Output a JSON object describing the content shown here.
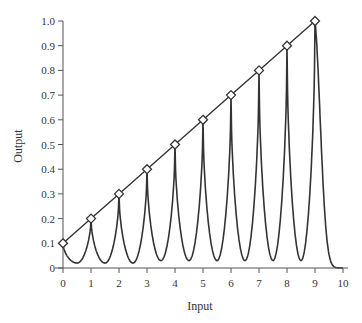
{
  "chart_data": {
    "type": "line",
    "title": "",
    "xlabel": "Input",
    "ylabel": "Output",
    "xlim": [
      0,
      10
    ],
    "ylim": [
      0,
      1.0
    ],
    "grid": false,
    "legend": null,
    "xticks": [
      0,
      1,
      2,
      3,
      4,
      5,
      6,
      7,
      8,
      9,
      10
    ],
    "xtick_labels": [
      "0",
      "1",
      "2",
      "3",
      "4",
      "5",
      "6",
      "7",
      "8",
      "9",
      "10"
    ],
    "yticks": [
      0,
      0.1,
      0.2,
      0.3,
      0.4,
      0.5,
      0.6,
      0.7,
      0.8,
      0.9,
      1.0
    ],
    "ytick_labels": [
      "0",
      "0.1",
      "0.2",
      "0.3",
      "0.4",
      "0.5",
      "0.6",
      "0.7",
      "0.8",
      "0.9",
      "1.0"
    ],
    "series": [
      {
        "name": "Linear (markers)",
        "style": "line with diamond markers",
        "x": [
          0,
          1,
          2,
          3,
          4,
          5,
          6,
          7,
          8,
          9
        ],
        "y": [
          0.1,
          0.2,
          0.3,
          0.4,
          0.5,
          0.6,
          0.7,
          0.8,
          0.9,
          1.0
        ]
      },
      {
        "name": "Oscillating response",
        "style": "line",
        "peaks_x": [
          0,
          1,
          2,
          3,
          4,
          5,
          6,
          7,
          8,
          9
        ],
        "peaks_y": [
          0.1,
          0.2,
          0.3,
          0.4,
          0.5,
          0.6,
          0.7,
          0.8,
          0.9,
          1.0
        ],
        "troughs_x": [
          0.5,
          1.5,
          2.5,
          3.5,
          4.5,
          5.5,
          6.5,
          7.5,
          8.5
        ],
        "troughs_y": [
          0.02,
          0.02,
          0.02,
          0.03,
          0.03,
          0.03,
          0.03,
          0.03,
          0.03
        ],
        "tail": {
          "x_start": 9,
          "x_end": 10,
          "y_end": 0.0
        }
      }
    ],
    "colors": {
      "line": "#333333",
      "marker_fill": "#ffffff",
      "axis": "#555555"
    }
  }
}
